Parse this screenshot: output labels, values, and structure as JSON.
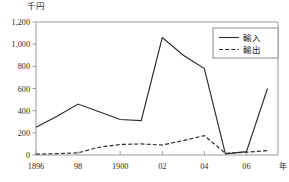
{
  "chart_data": {
    "type": "line",
    "title": "",
    "subtitle": "",
    "unit_label": "千円",
    "xlabel": "年",
    "ylabel": "",
    "xlim": [
      1896,
      1907.5
    ],
    "ylim": [
      0,
      1200
    ],
    "grid": false,
    "legend_position": "top-right",
    "y_ticks": [
      0,
      200,
      400,
      600,
      800,
      1000,
      1200
    ],
    "y_tick_labels": [
      "0",
      "200",
      "400",
      "600",
      "800",
      "1,000",
      "1,200"
    ],
    "x_ticks": [
      1896,
      1898,
      1900,
      1902,
      1904,
      1906
    ],
    "x_tick_labels": [
      "1896",
      "98",
      "1900",
      "02",
      "04",
      "06"
    ],
    "x": [
      1896,
      1897,
      1898,
      1899,
      1900,
      1901,
      1902,
      1903,
      1904,
      1905,
      1906,
      1907
    ],
    "series": [
      {
        "name": "輸入",
        "style": "solid",
        "color": "#2b2b2b",
        "values": [
          250,
          350,
          460,
          390,
          320,
          310,
          1060,
          900,
          780,
          10,
          30,
          600
        ]
      },
      {
        "name": "輸出",
        "style": "dashed",
        "color": "#2b2b2b",
        "values": [
          8,
          12,
          20,
          70,
          95,
          100,
          90,
          130,
          175,
          15,
          25,
          40
        ]
      }
    ]
  },
  "legend": {
    "items": [
      {
        "label": "輸入",
        "style": "solid"
      },
      {
        "label": "輸出",
        "style": "dashed"
      }
    ]
  },
  "colors": {
    "axis": "#9a9a9a",
    "line": "#2b2b2b",
    "text": "#2b2b2b",
    "legend_border": "#8d8d8d",
    "background": "#ffffff"
  }
}
